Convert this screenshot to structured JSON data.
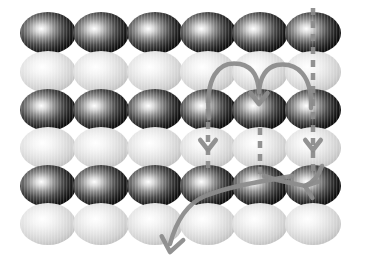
{
  "figure": {
    "background_color": "#ffffff",
    "width": 383,
    "height": 275
  },
  "lattice": {
    "rows": 6,
    "columns": 6,
    "ellipse_rx": 28,
    "ellipse_ry": 21,
    "column_centers": [
      48,
      101,
      155,
      208,
      260,
      313
    ],
    "row_centers": [
      33,
      72,
      110,
      148,
      186,
      224
    ],
    "row_types": [
      "dark",
      "light",
      "dark",
      "light",
      "dark",
      "light"
    ],
    "dark_sphere": {
      "label": "dark-ion",
      "edge_color": "#1a1a1a",
      "mid_color": "#6e6e6e",
      "highlight_color": "#ffffff",
      "highlight_offset_x": -0.12,
      "highlight_offset_y": -0.1
    },
    "light_sphere": {
      "label": "light-ion",
      "edge_color": "#c9c9c9",
      "mid_color": "#e2e2e2",
      "highlight_color": "#ffffff",
      "highlight_offset_x": -0.1,
      "highlight_offset_y": -0.12
    }
  },
  "annotations": {
    "stroke_color": "#8c8c8c",
    "stroke_width": 4.5,
    "dash_pattern": "7 6",
    "dashed_paths": [
      {
        "name": "dashed-path-col4",
        "d": "M 208 96 L 208 172",
        "description": "vertical dashed migration path, column 4, rows 3-4"
      },
      {
        "name": "dashed-path-col5",
        "d": "M 260 128 L 260 178",
        "description": "vertical dashed migration path, column 5, row 4"
      },
      {
        "name": "dashed-path-col6",
        "d": "M 313 8 L 313 176",
        "description": "long vertical dashed migration path, column 6, rows 1-5"
      }
    ],
    "arrows": [
      {
        "name": "arc-arrow-col4-to-col5",
        "d": "M 209 118 C 205 78, 218 60, 240 64 C 254 67, 258 78, 259 92",
        "description": "curved hop arrow from column 4 up and over into column 5"
      },
      {
        "name": "arc-arrow-col6-to-col5",
        "d": "M 311 108 C 312 76, 298 62, 277 65 C 264 68, 260 79, 259 92",
        "description": "curved hop arrow from column 6 up and over into column 5"
      },
      {
        "name": "long-arrow-down-left",
        "d": "M 292 176 C 258 182, 230 186, 205 196 C 186 204, 176 222, 170 244",
        "description": "long sweeping arrow exiting lattice toward lower-left"
      },
      {
        "name": "arc-arrow-into-col6-row5",
        "d": "M 264 176 C 282 182, 296 184, 306 186",
        "description": "short arrow feeding the convergence point at column 6 row 5"
      },
      {
        "name": "arc-arrow-col6-down-left",
        "d": "M 322 166 C 318 178, 312 183, 305 186",
        "description": "short curved arrow descending into convergence point"
      }
    ],
    "arrowheads": [
      {
        "name": "arrowhead-col4-row4",
        "x": 208,
        "y": 150,
        "angle": 90,
        "size": 10
      },
      {
        "name": "arrowhead-col6-row4",
        "x": 313,
        "y": 150,
        "angle": 90,
        "size": 10
      },
      {
        "name": "arrowhead-col5-row3",
        "x": 259,
        "y": 104,
        "angle": 90,
        "size": 11
      },
      {
        "name": "arrowhead-convergence",
        "x": 305,
        "y": 186,
        "angle": 200,
        "size": 11
      },
      {
        "name": "arrowhead-exit-bottom",
        "x": 170,
        "y": 252,
        "angle": 100,
        "size": 14
      }
    ]
  }
}
